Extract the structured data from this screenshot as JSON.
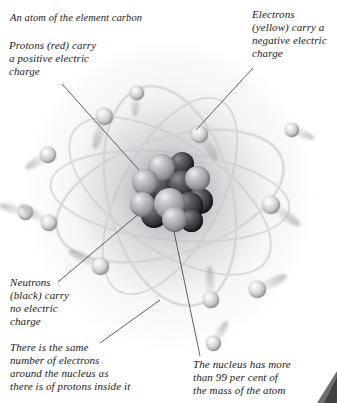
{
  "figure": {
    "title": "An atom of the element carbon",
    "colors": {
      "background": "#ffffff",
      "text": "#1a1a1a",
      "leader_line": "#3a3a3a",
      "nucleus_dark": "#1d1d21",
      "nucleus_light": "#b4b4ba",
      "electron": "#c9c9ce",
      "glow": "#cfcfd4",
      "corner_mark": "#4a4a4e"
    }
  },
  "captions": {
    "title": "An atom of the element carbon",
    "protons": "Protons (red) carry\na positive electric\ncharge",
    "electrons": "Electrons\n(yellow) carry a\nnegative electric\ncharge",
    "neutrons": "Neutrons\n(black) carry\nno electric\ncharge",
    "electron_count": "There is the same\nnumber of electrons\naround the nucleus as\nthere is of protons inside it",
    "nucleus_mass": "The nucleus has more\nthan 99 per cent of\nthe mass of the atom"
  },
  "labels": {
    "nucleus": "nucleus",
    "electron": "electron",
    "proton": "proton",
    "neutron": "neutron"
  },
  "diagram_data": {
    "type": "illustration",
    "element": "carbon",
    "proton_count": 6,
    "neutron_count": 6,
    "electron_count": 6,
    "nucleus_mass_percent": "99",
    "nucleons_drawn": 13,
    "electrons_drawn": 12,
    "orbit_paths": 5
  },
  "nucleons": [
    {
      "x": 18,
      "y": 2,
      "d": 27,
      "tone": "light"
    },
    {
      "x": 40,
      "y": 0,
      "d": 24,
      "tone": "dark"
    },
    {
      "x": 2,
      "y": 17,
      "d": 26,
      "tone": "light"
    },
    {
      "x": 55,
      "y": 14,
      "d": 25,
      "tone": "light"
    },
    {
      "x": 14,
      "y": 20,
      "d": 30,
      "tone": "dark"
    },
    {
      "x": 38,
      "y": 18,
      "d": 29,
      "tone": "dark"
    },
    {
      "x": 0,
      "y": 40,
      "d": 25,
      "tone": "light"
    },
    {
      "x": 57,
      "y": 36,
      "d": 26,
      "tone": "dark"
    },
    {
      "x": 24,
      "y": 36,
      "d": 31,
      "tone": "light"
    },
    {
      "x": 45,
      "y": 40,
      "d": 28,
      "tone": "dark"
    },
    {
      "x": 11,
      "y": 50,
      "d": 26,
      "tone": "dark"
    },
    {
      "x": 32,
      "y": 55,
      "d": 25,
      "tone": "light"
    },
    {
      "x": 50,
      "y": 57,
      "d": 23,
      "tone": "dark"
    }
  ],
  "electrons": [
    {
      "x": 96,
      "y": 108,
      "d": 17,
      "trail_angle": 108,
      "trail_len": 34
    },
    {
      "x": 191,
      "y": 126,
      "d": 17,
      "trail_angle": 56,
      "trail_len": 30
    },
    {
      "x": 40,
      "y": 147,
      "d": 16,
      "trail_angle": 150,
      "trail_len": 26
    },
    {
      "x": 262,
      "y": 196,
      "d": 18,
      "trail_angle": 36,
      "trail_len": 36
    },
    {
      "x": 18,
      "y": 205,
      "d": 15,
      "trail_angle": 196,
      "trail_len": 28
    },
    {
      "x": 41,
      "y": 215,
      "d": 16,
      "trail_angle": 212,
      "trail_len": 34
    },
    {
      "x": 92,
      "y": 258,
      "d": 17,
      "trail_angle": 206,
      "trail_len": 36
    },
    {
      "x": 249,
      "y": 281,
      "d": 17,
      "trail_angle": 334,
      "trail_len": 32
    },
    {
      "x": 203,
      "y": 292,
      "d": 16,
      "trail_angle": 268,
      "trail_len": 34
    },
    {
      "x": 285,
      "y": 123,
      "d": 14,
      "trail_angle": 22,
      "trail_len": 24
    },
    {
      "x": 130,
      "y": 86,
      "d": 14,
      "trail_angle": 96,
      "trail_len": 24
    },
    {
      "x": 206,
      "y": 336,
      "d": 15,
      "trail_angle": 300,
      "trail_len": 26
    }
  ],
  "leader_lines": [
    {
      "name": "protons-leader",
      "x1": 62,
      "y1": 84,
      "x2": 148,
      "y2": 180
    },
    {
      "name": "electrons-leader",
      "x1": 253,
      "y1": 68,
      "x2": 196,
      "y2": 130
    },
    {
      "name": "neutrons-leader",
      "x1": 58,
      "y1": 282,
      "x2": 148,
      "y2": 206
    },
    {
      "name": "same-leader",
      "x1": 100,
      "y1": 343,
      "x2": 160,
      "y2": 300
    },
    {
      "name": "mass-leader",
      "x1": 200,
      "y1": 356,
      "x2": 172,
      "y2": 222
    }
  ]
}
